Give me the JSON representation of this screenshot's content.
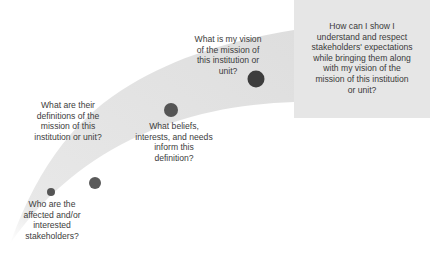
{
  "diagram": {
    "type": "progression-ribbon",
    "colors": {
      "ribbon": "#e3e3e3",
      "box": "#e6e6e6",
      "dot": "#555555",
      "text": "#3c3c3c"
    },
    "steps": [
      {
        "id": 1,
        "text": "Who are the affected and/or interested stakeholders?",
        "lines": [
          "Who are the",
          "affected and/or",
          "interested",
          "stakeholders?"
        ]
      },
      {
        "id": 2,
        "text": "What are their definitions of the mission of this institution or unit?",
        "lines": [
          "What are their",
          "definitions of the",
          "mission of this",
          "institution or unit?"
        ]
      },
      {
        "id": 3,
        "text": "What beliefs, interests, and needs inform this definition?",
        "lines": [
          "What beliefs,",
          "interests, and needs",
          "inform this",
          "definition?"
        ]
      },
      {
        "id": 4,
        "text": "What is my vision of the mission of this institution or unit?",
        "lines": [
          "What is my vision",
          "of the mission of",
          "this institution or",
          "unit?"
        ]
      }
    ],
    "goal_box": {
      "text": "How can I show I understand and respect stakeholders' expectations while bringing them along with my vision of the mission of this institution or unit?",
      "lines": [
        "How can I show I",
        "understand and respect",
        "stakeholders' expectations",
        "while bringing them along",
        "with my vision of the",
        "mission of this institution",
        "or unit?"
      ]
    }
  }
}
